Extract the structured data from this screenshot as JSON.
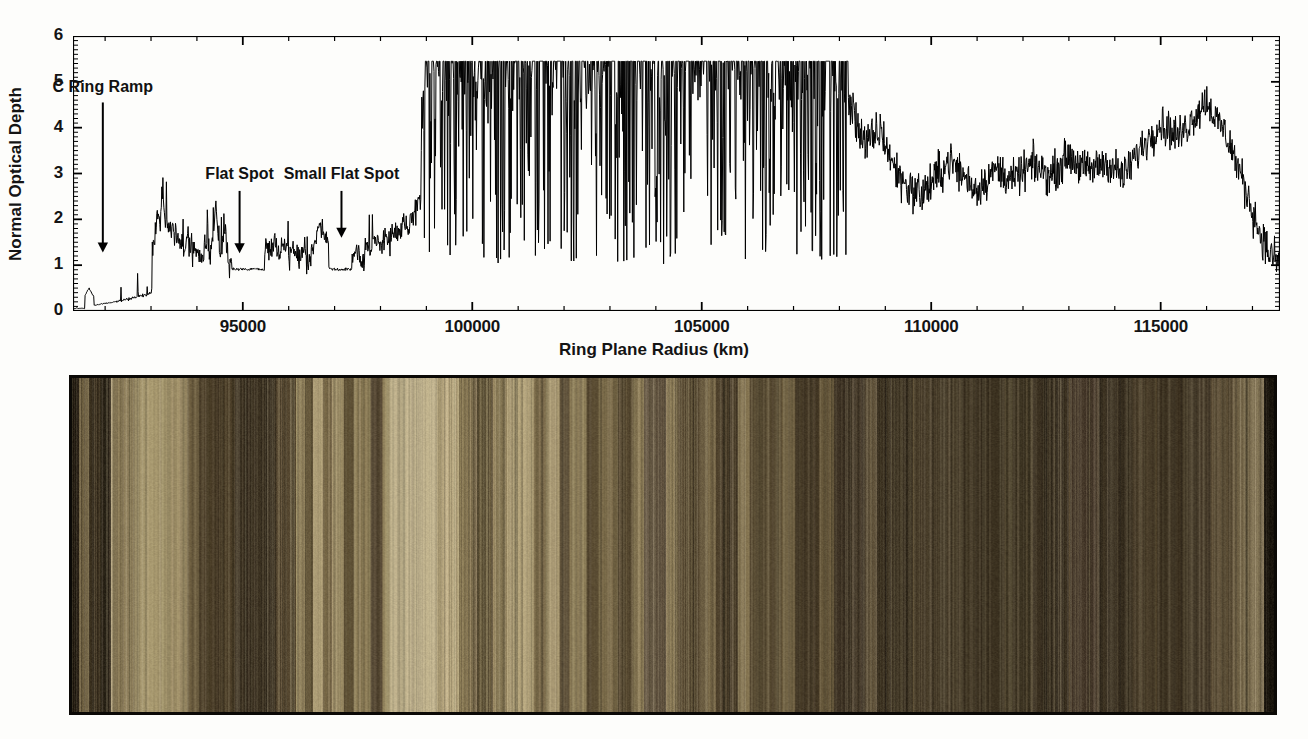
{
  "figure": {
    "panels": [
      "optical-depth-profile",
      "ring-color-image-strip"
    ]
  },
  "chart_data": {
    "type": "line",
    "title": "",
    "xlabel": "Ring Plane Radius (km)",
    "ylabel": "Normal Optical Depth",
    "xlim": [
      91300,
      117600
    ],
    "ylim": [
      0,
      6
    ],
    "xticks": [
      95000,
      100000,
      105000,
      110000,
      115000
    ],
    "xtick_labels": [
      "95000",
      "100000",
      "105000",
      "110000",
      "115000"
    ],
    "xtick_minor_step": 1000,
    "yticks": [
      0,
      1,
      2,
      3,
      4,
      5,
      6
    ],
    "ytick_labels": [
      "0",
      "1",
      "2",
      "3",
      "4",
      "5",
      "6"
    ],
    "ytick_minor_step": 0.1,
    "grid": false,
    "legend": null,
    "line_color": "#000000",
    "line_width": 1.0,
    "saturation_level": 5.45,
    "annotations": [
      {
        "text": "C Ring Ramp",
        "x": 91950,
        "label_y": 4.85,
        "arrow_from_y": 4.55,
        "arrow_to_y": 1.3
      },
      {
        "text": "Flat Spot",
        "x": 94930,
        "label_y": 2.95,
        "arrow_from_y": 2.62,
        "arrow_to_y": 1.28
      },
      {
        "text": "Small Flat Spot",
        "x": 97150,
        "label_y": 2.95,
        "arrow_from_y": 2.62,
        "arrow_to_y": 1.62
      }
    ],
    "regions": [
      {
        "name": "C Ring inner",
        "x_start": 91300,
        "x_end": 92200,
        "typical_depth": 0.12
      },
      {
        "name": "C Ring",
        "x_start": 92200,
        "x_end": 98900,
        "typical_depth": 1.2
      },
      {
        "name": "B Ring (saturated)",
        "x_start": 98900,
        "x_end": 108200,
        "typical_depth": 5.45
      },
      {
        "name": "Outer B Ring",
        "x_start": 108200,
        "x_end": 117600,
        "typical_depth": 2.6
      }
    ],
    "series": [
      {
        "name": "Normal Optical Depth",
        "x": [
          91300,
          91400,
          91500,
          91600,
          91650,
          91700,
          91750,
          91800,
          91850,
          91900,
          92000,
          92100,
          92200,
          92300,
          92400,
          92500,
          92600,
          92700,
          92800,
          92900,
          93000,
          93050,
          93100,
          93150,
          93200,
          93250,
          93300,
          93350,
          93400,
          93450,
          93500,
          93600,
          93700,
          93800,
          93900,
          94000,
          94100,
          94200,
          94300,
          94400,
          94500,
          94600,
          94700,
          94750,
          94800,
          94900,
          95000,
          95100,
          95200,
          95300,
          95400,
          95500,
          95600,
          95700,
          95800,
          95900,
          96000,
          96100,
          96200,
          96300,
          96400,
          96500,
          96600,
          96700,
          96800,
          96900,
          97000,
          97100,
          97200,
          97300,
          97400,
          97500,
          97600,
          97700,
          97800,
          97900,
          98000,
          98100,
          98200,
          98300,
          98400,
          98500,
          98600,
          98700,
          98800,
          98900,
          99000,
          99200,
          99400,
          99600,
          99800,
          100000,
          100500,
          101000,
          101500,
          102000,
          102500,
          103000,
          103500,
          104000,
          104500,
          105000,
          105500,
          106000,
          106500,
          107000,
          107500,
          108000,
          108300,
          108600,
          108900,
          109200,
          109500,
          109800,
          110100,
          110400,
          110700,
          111000,
          111400,
          111800,
          112200,
          112600,
          113000,
          113400,
          113800,
          114200,
          114600,
          115000,
          115400,
          115800,
          116000,
          116200,
          116400,
          116600,
          116800,
          117000,
          117200,
          117400,
          117600
        ],
        "y": [
          0.05,
          0.07,
          0.08,
          0.45,
          0.5,
          0.3,
          0.12,
          0.13,
          0.14,
          0.15,
          0.17,
          0.18,
          0.2,
          0.22,
          0.24,
          0.26,
          0.28,
          0.32,
          0.34,
          0.36,
          0.38,
          1.4,
          1.85,
          2.2,
          1.95,
          2.7,
          2.1,
          1.75,
          1.9,
          1.6,
          1.8,
          1.55,
          1.3,
          1.45,
          1.2,
          1.35,
          1.1,
          1.5,
          1.25,
          2.35,
          1.15,
          1.95,
          1.0,
          0.92,
          0.9,
          0.9,
          0.9,
          0.9,
          0.91,
          0.92,
          0.94,
          1.45,
          1.3,
          1.55,
          1.2,
          1.4,
          1.15,
          1.35,
          1.1,
          1.25,
          1.05,
          1.3,
          1.55,
          1.95,
          1.7,
          1.2,
          1.0,
          0.92,
          0.93,
          0.95,
          1.2,
          1.35,
          1.1,
          1.45,
          1.25,
          1.55,
          1.4,
          1.7,
          1.5,
          1.8,
          1.6,
          1.9,
          1.75,
          2.05,
          2.2,
          2.6,
          5.45,
          3.2,
          5.45,
          2.4,
          5.45,
          5.45,
          4.1,
          5.45,
          3.5,
          5.45,
          2.9,
          5.45,
          5.45,
          3.8,
          5.45,
          5.45,
          5.45,
          5.45,
          5.45,
          5.45,
          5.45,
          5.1,
          4.3,
          3.6,
          3.95,
          3.1,
          2.7,
          2.55,
          2.9,
          3.3,
          2.95,
          2.65,
          3.1,
          2.85,
          3.2,
          2.95,
          3.4,
          3.05,
          3.25,
          2.95,
          3.6,
          4.1,
          3.8,
          4.35,
          4.6,
          4.2,
          3.9,
          3.4,
          2.8,
          2.2,
          1.6,
          1.2,
          1.05
        ]
      }
    ]
  },
  "ring_strip": {
    "name": "Saturn ring color image strip",
    "border_color": "#0b0906",
    "palette": {
      "lightest": "#cfc19d",
      "light": "#b5a582",
      "mid": "#8a7854",
      "dark": "#5a4a30",
      "darkest": "#342a1a"
    },
    "bands": [
      {
        "x": 0.0,
        "w": 0.006,
        "color": "#2a2216"
      },
      {
        "x": 0.006,
        "w": 0.008,
        "color": "#6d5e40"
      },
      {
        "x": 0.014,
        "w": 0.01,
        "color": "#3d3220"
      },
      {
        "x": 0.024,
        "w": 0.008,
        "color": "#2e2619"
      },
      {
        "x": 0.032,
        "w": 0.02,
        "color": "#8d7d58"
      },
      {
        "x": 0.052,
        "w": 0.03,
        "color": "#a8996f"
      },
      {
        "x": 0.082,
        "w": 0.014,
        "color": "#9a8a63"
      },
      {
        "x": 0.096,
        "w": 0.01,
        "color": "#6e5f41"
      },
      {
        "x": 0.106,
        "w": 0.03,
        "color": "#4a3d27"
      },
      {
        "x": 0.136,
        "w": 0.034,
        "color": "#3a3020"
      },
      {
        "x": 0.17,
        "w": 0.016,
        "color": "#554730"
      },
      {
        "x": 0.186,
        "w": 0.008,
        "color": "#9c8c64"
      },
      {
        "x": 0.194,
        "w": 0.006,
        "color": "#6a5c3e"
      },
      {
        "x": 0.2,
        "w": 0.009,
        "color": "#b0a077"
      },
      {
        "x": 0.209,
        "w": 0.007,
        "color": "#7a6a48"
      },
      {
        "x": 0.216,
        "w": 0.01,
        "color": "#a09068"
      },
      {
        "x": 0.226,
        "w": 0.008,
        "color": "#5e5034"
      },
      {
        "x": 0.234,
        "w": 0.014,
        "color": "#8c7c56"
      },
      {
        "x": 0.248,
        "w": 0.01,
        "color": "#534530"
      },
      {
        "x": 0.258,
        "w": 0.006,
        "color": "#9a8a62"
      },
      {
        "x": 0.264,
        "w": 0.04,
        "color": "#c2b48e"
      },
      {
        "x": 0.304,
        "w": 0.018,
        "color": "#b4a47c"
      },
      {
        "x": 0.322,
        "w": 0.012,
        "color": "#8a7a55"
      },
      {
        "x": 0.334,
        "w": 0.016,
        "color": "#6a5c3e"
      },
      {
        "x": 0.35,
        "w": 0.012,
        "color": "#90805a"
      },
      {
        "x": 0.362,
        "w": 0.022,
        "color": "#b2a279"
      },
      {
        "x": 0.384,
        "w": 0.01,
        "color": "#7e6e4c"
      },
      {
        "x": 0.394,
        "w": 0.012,
        "color": "#a89870"
      },
      {
        "x": 0.406,
        "w": 0.008,
        "color": "#60523a"
      },
      {
        "x": 0.414,
        "w": 0.014,
        "color": "#8e7e58"
      },
      {
        "x": 0.428,
        "w": 0.01,
        "color": "#5c4e34"
      },
      {
        "x": 0.438,
        "w": 0.016,
        "color": "#7c6c4a"
      },
      {
        "x": 0.454,
        "w": 0.012,
        "color": "#574930"
      },
      {
        "x": 0.466,
        "w": 0.01,
        "color": "#8a7a55"
      },
      {
        "x": 0.476,
        "w": 0.018,
        "color": "#625440"
      },
      {
        "x": 0.494,
        "w": 0.01,
        "color": "#8c7c58"
      },
      {
        "x": 0.504,
        "w": 0.02,
        "color": "#5a4c33"
      },
      {
        "x": 0.524,
        "w": 0.012,
        "color": "#7a6a4a"
      },
      {
        "x": 0.536,
        "w": 0.018,
        "color": "#4e412c"
      },
      {
        "x": 0.554,
        "w": 0.01,
        "color": "#83735010"
      },
      {
        "x": 0.564,
        "w": 0.024,
        "color": "#53462e"
      },
      {
        "x": 0.588,
        "w": 0.014,
        "color": "#6b5c3e"
      },
      {
        "x": 0.602,
        "w": 0.02,
        "color": "#463a26"
      },
      {
        "x": 0.622,
        "w": 0.012,
        "color": "#6a5b3d"
      },
      {
        "x": 0.634,
        "w": 0.026,
        "color": "#413626"
      },
      {
        "x": 0.66,
        "w": 0.01,
        "color": "#60523a"
      },
      {
        "x": 0.67,
        "w": 0.03,
        "color": "#3d3322"
      },
      {
        "x": 0.7,
        "w": 0.04,
        "color": "#463b28"
      },
      {
        "x": 0.74,
        "w": 0.034,
        "color": "#3b3120"
      },
      {
        "x": 0.774,
        "w": 0.026,
        "color": "#443a26"
      },
      {
        "x": 0.8,
        "w": 0.03,
        "color": "#3a3020"
      },
      {
        "x": 0.83,
        "w": 0.024,
        "color": "#46392a"
      },
      {
        "x": 0.854,
        "w": 0.028,
        "color": "#3c3222"
      },
      {
        "x": 0.882,
        "w": 0.02,
        "color": "#4a3e2a"
      },
      {
        "x": 0.902,
        "w": 0.026,
        "color": "#3f3422"
      },
      {
        "x": 0.928,
        "w": 0.02,
        "color": "#4b3f2c"
      },
      {
        "x": 0.948,
        "w": 0.018,
        "color": "#5a4c34"
      },
      {
        "x": 0.966,
        "w": 0.014,
        "color": "#6e6044"
      },
      {
        "x": 0.98,
        "w": 0.012,
        "color": "#7c6e50"
      },
      {
        "x": 0.992,
        "w": 0.008,
        "color": "#1b160e"
      }
    ]
  }
}
